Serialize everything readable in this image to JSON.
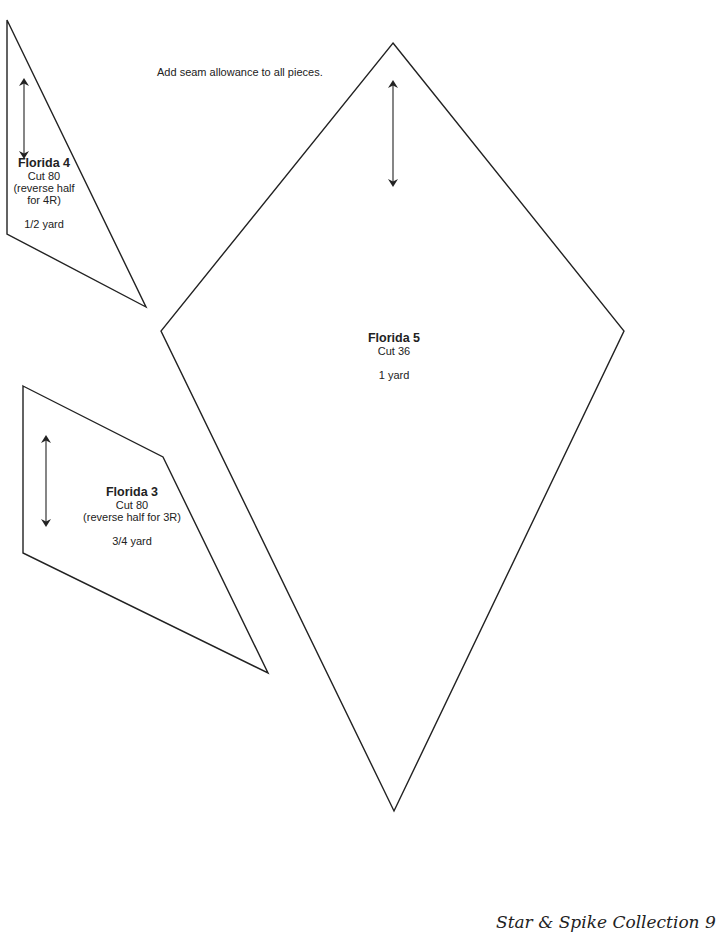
{
  "note": "Add seam allowance to all pieces.",
  "pieces": [
    {
      "name": "Florida 4",
      "cut": "Cut 80",
      "reverse_line1": "(reverse half",
      "reverse_line2": "for 4R)",
      "yardage": "1/2 yard",
      "shape": "triangle",
      "points": "7,20 7,234 146,307",
      "grain_arrow": {
        "x1": 24,
        "y1": 82,
        "x2": 24,
        "y2": 155
      }
    },
    {
      "name": "Florida 5",
      "cut": "Cut 36",
      "yardage": "1 yard",
      "shape": "diamond",
      "points": "393,43 624,331 394,811 161,331",
      "grain_arrow": {
        "x1": 393,
        "y1": 84,
        "x2": 393,
        "y2": 183
      }
    },
    {
      "name": "Florida 3",
      "cut": "Cut 80",
      "reverse": "(reverse half for 3R)",
      "yardage": "3/4 yard",
      "shape": "quadrilateral",
      "points": "23,386 163,457 268,673 23,553",
      "grain_arrow": {
        "x1": 46,
        "y1": 439,
        "x2": 46,
        "y2": 523
      }
    }
  ],
  "footer": {
    "text": "Star & Spike Collection   9"
  },
  "colors": {
    "line": "#222222",
    "background": "#ffffff"
  }
}
